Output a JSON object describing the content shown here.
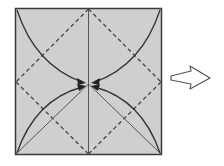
{
  "diagram": {
    "type": "origami-fold-step",
    "paper": {
      "fill": "#cfcfcf",
      "border": "#3a3a3a",
      "x": 15,
      "y": 8,
      "size": 147
    },
    "lines": {
      "center_vertical": "valley-crease",
      "diamond": "dashed-fold-lines",
      "diagonals_bottom": "solid-creases"
    },
    "arrows": [
      {
        "from": "top-left-corner",
        "to": "center"
      },
      {
        "from": "top-right-corner",
        "to": "center"
      },
      {
        "from": "bottom-left-corner",
        "to": "center"
      },
      {
        "from": "bottom-right-corner",
        "to": "center"
      }
    ],
    "next_step_arrow": {
      "direction": "right",
      "style": "outline"
    },
    "colors": {
      "paper": "#cfcfcf",
      "line": "#3a3a3a",
      "dash": "#444444",
      "arrow_outline": "#555555"
    }
  }
}
